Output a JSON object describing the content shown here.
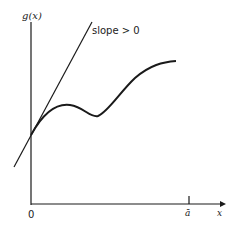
{
  "diagram": {
    "y_axis_label": "g(x)",
    "x_axis_label": "x",
    "origin_label": "0",
    "tick_label": "ā",
    "tangent_label": "slope > 0",
    "colors": {
      "ink": "#1a1a1a",
      "background": "#ffffff"
    }
  }
}
